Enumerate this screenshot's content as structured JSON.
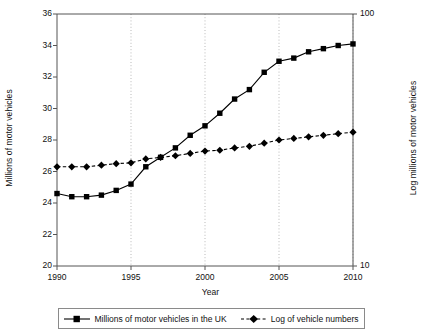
{
  "chart_data": {
    "type": "line",
    "title": "",
    "xlabel": "Year",
    "ylabel": "Millions of motor vehicles",
    "ylabel_right": "Log millions of motor vehicles",
    "xlim": [
      1990,
      2010
    ],
    "ylim": [
      20,
      36
    ],
    "ylim_right": [
      10,
      100
    ],
    "yscale_right": "log",
    "grid": "vertical-dotted",
    "legend_position": "bottom",
    "xticks": [
      "1990",
      "1995",
      "2000",
      "2005",
      "2010"
    ],
    "xtick_values": [
      1990,
      1995,
      2000,
      2005,
      2010
    ],
    "yticks": [
      "20",
      "22",
      "24",
      "26",
      "28",
      "30",
      "32",
      "34",
      "36"
    ],
    "ytick_values": [
      20,
      22,
      24,
      26,
      28,
      30,
      32,
      34,
      36
    ],
    "yticks_right": [
      "10",
      "100"
    ],
    "ytick_values_right": [
      10,
      100
    ],
    "x": [
      1990,
      1991,
      1992,
      1993,
      1994,
      1995,
      1996,
      1997,
      1998,
      1999,
      2000,
      2001,
      2002,
      2003,
      2004,
      2005,
      2006,
      2007,
      2008,
      2009,
      2010
    ],
    "series": [
      {
        "name": "Millions of motor vehicles in the UK",
        "marker": "square",
        "linestyle": "solid",
        "color": "#000000",
        "axis": "left",
        "values": [
          24.6,
          24.4,
          24.4,
          24.5,
          24.8,
          25.2,
          26.3,
          26.9,
          27.5,
          28.3,
          28.9,
          29.7,
          30.6,
          31.2,
          32.3,
          33.0,
          33.2,
          33.6,
          33.8,
          34.0,
          34.1
        ]
      },
      {
        "name": "Log of vehicle numbers",
        "marker": "diamond",
        "linestyle": "dashed",
        "color": "#000000",
        "axis": "right",
        "values": [
          26.3,
          26.3,
          26.3,
          26.4,
          26.5,
          26.55,
          26.8,
          26.9,
          27.0,
          27.15,
          27.3,
          27.35,
          27.5,
          27.6,
          27.8,
          28.0,
          28.1,
          28.2,
          28.3,
          28.4,
          28.5
        ]
      }
    ]
  },
  "legend": {
    "items": [
      {
        "label": "Millions of motor vehicles in the UK"
      },
      {
        "label": "Log of vehicle numbers"
      }
    ]
  }
}
